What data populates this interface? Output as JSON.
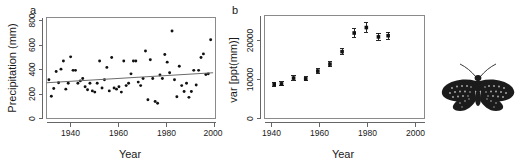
{
  "figure": {
    "panel_a_label": "a",
    "panel_b_label": "b",
    "organism_icon": "moth-icon"
  },
  "chart_data": [
    {
      "type": "scatter",
      "panel": "a",
      "title": "",
      "xlabel": "Year",
      "ylabel": "Precipitation (mm)",
      "xlim": [
        1930,
        2000
      ],
      "ylim": [
        0,
        860
      ],
      "xticks": [
        1940,
        1960,
        1980,
        2000
      ],
      "yticks": [
        0,
        200,
        400,
        600,
        800
      ],
      "xticklabels": [
        "1940",
        "1960",
        "1980",
        "2000"
      ],
      "yticklabels": [
        "0",
        "200",
        "400",
        "600",
        "800"
      ],
      "grid": false,
      "legend": false,
      "marker": "filled-circle",
      "points": [
        {
          "x": 1931,
          "y": 330
        },
        {
          "x": 1932,
          "y": 190
        },
        {
          "x": 1933,
          "y": 255
        },
        {
          "x": 1934,
          "y": 400
        },
        {
          "x": 1935,
          "y": 305
        },
        {
          "x": 1936,
          "y": 420
        },
        {
          "x": 1937,
          "y": 490
        },
        {
          "x": 1938,
          "y": 250
        },
        {
          "x": 1939,
          "y": 300
        },
        {
          "x": 1940,
          "y": 525
        },
        {
          "x": 1941,
          "y": 410
        },
        {
          "x": 1942,
          "y": 410
        },
        {
          "x": 1943,
          "y": 300
        },
        {
          "x": 1944,
          "y": 320
        },
        {
          "x": 1945,
          "y": 340
        },
        {
          "x": 1946,
          "y": 270
        },
        {
          "x": 1947,
          "y": 245
        },
        {
          "x": 1948,
          "y": 300
        },
        {
          "x": 1949,
          "y": 235
        },
        {
          "x": 1950,
          "y": 225
        },
        {
          "x": 1951,
          "y": 300
        },
        {
          "x": 1952,
          "y": 490
        },
        {
          "x": 1953,
          "y": 260
        },
        {
          "x": 1954,
          "y": 330
        },
        {
          "x": 1955,
          "y": 435
        },
        {
          "x": 1956,
          "y": 235
        },
        {
          "x": 1957,
          "y": 520
        },
        {
          "x": 1958,
          "y": 260
        },
        {
          "x": 1959,
          "y": 250
        },
        {
          "x": 1960,
          "y": 270
        },
        {
          "x": 1961,
          "y": 225
        },
        {
          "x": 1962,
          "y": 490
        },
        {
          "x": 1963,
          "y": 280
        },
        {
          "x": 1964,
          "y": 300
        },
        {
          "x": 1965,
          "y": 380
        },
        {
          "x": 1966,
          "y": 490
        },
        {
          "x": 1967,
          "y": 490
        },
        {
          "x": 1968,
          "y": 310
        },
        {
          "x": 1969,
          "y": 280
        },
        {
          "x": 1970,
          "y": 340
        },
        {
          "x": 1971,
          "y": 575
        },
        {
          "x": 1972,
          "y": 160
        },
        {
          "x": 1973,
          "y": 500
        },
        {
          "x": 1974,
          "y": 340
        },
        {
          "x": 1975,
          "y": 145
        },
        {
          "x": 1976,
          "y": 130
        },
        {
          "x": 1977,
          "y": 370
        },
        {
          "x": 1978,
          "y": 340
        },
        {
          "x": 1979,
          "y": 545
        },
        {
          "x": 1980,
          "y": 480
        },
        {
          "x": 1981,
          "y": 390
        },
        {
          "x": 1982,
          "y": 745
        },
        {
          "x": 1983,
          "y": 330
        },
        {
          "x": 1984,
          "y": 185
        },
        {
          "x": 1985,
          "y": 445
        },
        {
          "x": 1986,
          "y": 280
        },
        {
          "x": 1987,
          "y": 230
        },
        {
          "x": 1988,
          "y": 300
        },
        {
          "x": 1989,
          "y": 180
        },
        {
          "x": 1990,
          "y": 230
        },
        {
          "x": 1991,
          "y": 410
        },
        {
          "x": 1992,
          "y": 285
        },
        {
          "x": 1993,
          "y": 410
        },
        {
          "x": 1994,
          "y": 520
        },
        {
          "x": 1995,
          "y": 550
        },
        {
          "x": 1996,
          "y": 375
        },
        {
          "x": 1997,
          "y": 380
        },
        {
          "x": 1998,
          "y": 670
        }
      ],
      "trendline": {
        "x0": 1930,
        "y0": 305,
        "x1": 1999,
        "y1": 390
      }
    },
    {
      "type": "scatter",
      "panel": "b",
      "title": "",
      "xlabel": "Year",
      "ylabel": "var [ppt(mm)]",
      "xlim": [
        1937,
        2003
      ],
      "ylim": [
        0,
        26500
      ],
      "xticks": [
        1940,
        1960,
        1980,
        2000
      ],
      "yticks": [
        0,
        10000,
        20000
      ],
      "xticklabels": [
        "1940",
        "1960",
        "1980",
        "2000"
      ],
      "yticklabels": [
        "0",
        "10000",
        "20000"
      ],
      "grid": false,
      "legend": false,
      "marker": "filled-square-with-errorbars",
      "points": [
        {
          "x": 1941,
          "y": 8800,
          "err": 500
        },
        {
          "x": 1944,
          "y": 8900,
          "err": 500
        },
        {
          "x": 1949,
          "y": 10400,
          "err": 550
        },
        {
          "x": 1954,
          "y": 10200,
          "err": 550
        },
        {
          "x": 1959,
          "y": 12200,
          "err": 600
        },
        {
          "x": 1964,
          "y": 14000,
          "err": 650
        },
        {
          "x": 1969,
          "y": 17200,
          "err": 700
        },
        {
          "x": 1974,
          "y": 22000,
          "err": 1100
        },
        {
          "x": 1979,
          "y": 23400,
          "err": 1200
        },
        {
          "x": 1984,
          "y": 21000,
          "err": 900
        },
        {
          "x": 1988,
          "y": 21300,
          "err": 950
        }
      ]
    }
  ]
}
